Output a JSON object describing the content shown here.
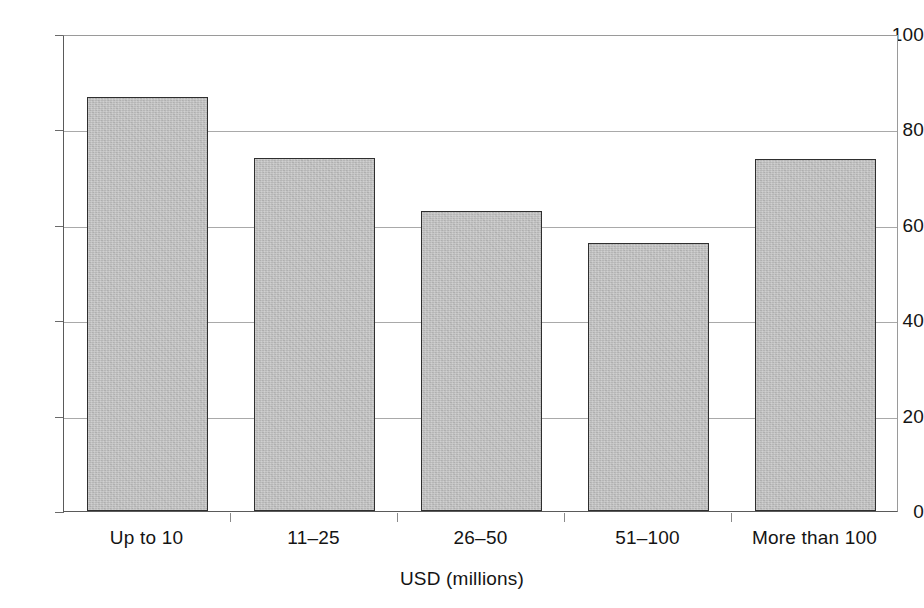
{
  "chart_data": {
    "type": "bar",
    "title": "",
    "subtitle": "",
    "xlabel": "USD (millions)",
    "ylabel": "",
    "categories": [
      "Up to 10",
      "11–25",
      "26–50",
      "51–100",
      "More than 100"
    ],
    "values": [
      86.8,
      74.0,
      62.8,
      56.2,
      73.7
    ],
    "series": [
      {
        "name": "",
        "values": [
          86.8,
          74.0,
          62.8,
          56.2,
          73.7
        ]
      }
    ],
    "ylim": [
      0,
      100
    ],
    "y_ticks": [
      0,
      20,
      40,
      60,
      80,
      100
    ],
    "y_tick_labels": [
      "0",
      "20",
      "40",
      "60",
      "80",
      "100"
    ],
    "grid": "horizontal",
    "legend": "none",
    "annotations": [],
    "bar_color": "#b6b6b6",
    "bar_border_color": "#2f2f2f",
    "gridline_color": "#a9a9a9",
    "axis_color": "#5a5a5a",
    "background_color": "#ffffff"
  }
}
